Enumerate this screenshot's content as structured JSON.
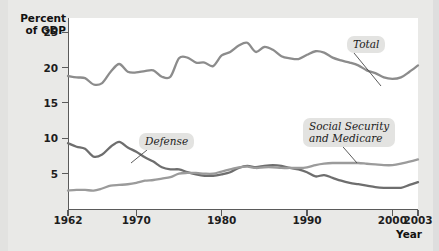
{
  "figure": {
    "background_color": "#e9e9e7",
    "plot_background_color": "#ffffff"
  },
  "axis_titles": {
    "y": "Percent\nof GDP",
    "x": "Year"
  },
  "callouts": {
    "total": "Total",
    "defense": "Defense",
    "social_security": "Social Security\nand Medicare"
  },
  "colors": {
    "total_line": "#8c8c8c",
    "defense_line": "#6e6e6e",
    "social_security_line": "#9b9b9b",
    "axis": "#5a5a5a",
    "callout_bg": "#e3e3e1",
    "text": "#1b1b1b"
  },
  "chart_data": {
    "type": "line",
    "title": "",
    "xlabel": "Year",
    "ylabel": "Percent of GDP",
    "xlim": [
      1962,
      2003
    ],
    "ylim": [
      0,
      27
    ],
    "yticks": [
      5,
      10,
      15,
      20,
      25
    ],
    "xticks": [
      1962,
      1970,
      1980,
      1990,
      2000,
      2003
    ],
    "grid": false,
    "legend": "inline-callouts",
    "x": [
      1962,
      1963,
      1964,
      1965,
      1966,
      1967,
      1968,
      1969,
      1970,
      1971,
      1972,
      1973,
      1974,
      1975,
      1976,
      1977,
      1978,
      1979,
      1980,
      1981,
      1982,
      1983,
      1984,
      1985,
      1986,
      1987,
      1988,
      1989,
      1990,
      1991,
      1992,
      1993,
      1994,
      1995,
      1996,
      1997,
      1998,
      1999,
      2000,
      2001,
      2002,
      2003
    ],
    "series": [
      {
        "name": "Total",
        "color": "#8c8c8c",
        "values": [
          18.8,
          18.6,
          18.5,
          17.6,
          17.8,
          19.4,
          20.5,
          19.4,
          19.3,
          19.5,
          19.6,
          18.7,
          18.7,
          21.3,
          21.4,
          20.7,
          20.7,
          20.2,
          21.7,
          22.2,
          23.1,
          23.5,
          22.2,
          22.9,
          22.5,
          21.6,
          21.3,
          21.2,
          21.8,
          22.3,
          22.1,
          21.4,
          21.0,
          20.7,
          20.3,
          19.6,
          19.2,
          18.6,
          18.4,
          18.6,
          19.4,
          20.3
        ]
      },
      {
        "name": "Defense",
        "color": "#6e6e6e",
        "values": [
          9.3,
          8.8,
          8.5,
          7.4,
          7.7,
          8.8,
          9.5,
          8.7,
          8.1,
          7.3,
          6.7,
          5.9,
          5.6,
          5.6,
          5.2,
          4.9,
          4.7,
          4.7,
          4.9,
          5.2,
          5.8,
          6.1,
          5.9,
          6.1,
          6.2,
          6.1,
          5.8,
          5.6,
          5.2,
          4.6,
          4.8,
          4.4,
          4.0,
          3.7,
          3.5,
          3.3,
          3.1,
          3.0,
          3.0,
          3.0,
          3.4,
          3.8
        ]
      },
      {
        "name": "Social Security and Medicare",
        "color": "#9b9b9b",
        "values": [
          2.6,
          2.7,
          2.7,
          2.6,
          2.9,
          3.3,
          3.4,
          3.5,
          3.7,
          4.0,
          4.1,
          4.3,
          4.5,
          5.0,
          5.1,
          5.1,
          5.0,
          5.0,
          5.3,
          5.6,
          5.9,
          6.0,
          5.8,
          5.9,
          5.9,
          5.8,
          5.8,
          5.8,
          5.9,
          6.2,
          6.4,
          6.5,
          6.5,
          6.5,
          6.5,
          6.4,
          6.3,
          6.2,
          6.2,
          6.4,
          6.7,
          7.0
        ]
      }
    ]
  }
}
